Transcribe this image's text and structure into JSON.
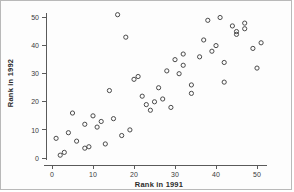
{
  "chart_data": {
    "type": "scatter",
    "title": "",
    "xlabel": "Rank in 1991",
    "ylabel": "Rank in 1992",
    "xlim": [
      0,
      52
    ],
    "ylim": [
      0,
      53
    ],
    "xticks": [
      0,
      10,
      20,
      30,
      40,
      50
    ],
    "yticks": [
      0,
      10,
      20,
      30,
      40,
      50
    ],
    "xtick_labels": [
      "0",
      "10",
      "20",
      "30",
      "40",
      "50"
    ],
    "ytick_labels": [
      "0",
      "10",
      "20",
      "30",
      "40",
      "50"
    ],
    "grid": false,
    "legend": null,
    "marker": "open-circle",
    "marker_color": "#4a4a4a",
    "points": [
      [
        1,
        7
      ],
      [
        2,
        1
      ],
      [
        3,
        2
      ],
      [
        4,
        9
      ],
      [
        5,
        16
      ],
      [
        6,
        6
      ],
      [
        8,
        3.5
      ],
      [
        8,
        12
      ],
      [
        9,
        4
      ],
      [
        10,
        15
      ],
      [
        11,
        11
      ],
      [
        12,
        13
      ],
      [
        13,
        5
      ],
      [
        14,
        24
      ],
      [
        15,
        14
      ],
      [
        16,
        51
      ],
      [
        17,
        8
      ],
      [
        18,
        43
      ],
      [
        19,
        10
      ],
      [
        20,
        28
      ],
      [
        21,
        29
      ],
      [
        22,
        22
      ],
      [
        23,
        19
      ],
      [
        24,
        17
      ],
      [
        25,
        20
      ],
      [
        26,
        25
      ],
      [
        27,
        21
      ],
      [
        28,
        31
      ],
      [
        29,
        18
      ],
      [
        30,
        35
      ],
      [
        31,
        30
      ],
      [
        32,
        37
      ],
      [
        32,
        33
      ],
      [
        34,
        26
      ],
      [
        34,
        23
      ],
      [
        36,
        36
      ],
      [
        37,
        42
      ],
      [
        38,
        49
      ],
      [
        39,
        38
      ],
      [
        40,
        40
      ],
      [
        41,
        50
      ],
      [
        42,
        34
      ],
      [
        42,
        27
      ],
      [
        44,
        47
      ],
      [
        45,
        45
      ],
      [
        45,
        44
      ],
      [
        47,
        48
      ],
      [
        47,
        46
      ],
      [
        49,
        39
      ],
      [
        50,
        32
      ],
      [
        51,
        41
      ]
    ]
  },
  "axes": {
    "x_title": "Rank in 1991",
    "y_title": "Rank in 1992"
  }
}
